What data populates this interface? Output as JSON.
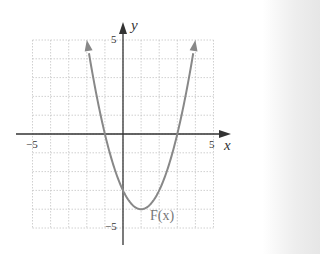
{
  "chart_data": {
    "type": "line",
    "title": "",
    "xlabel": "x",
    "ylabel": "y",
    "xlim": [
      -5,
      5
    ],
    "ylim": [
      -5,
      5
    ],
    "grid": true,
    "grid_style": "dotted",
    "x_tick_labels": [
      "-5",
      "5"
    ],
    "y_tick_labels": [
      "5",
      "-5"
    ],
    "series": [
      {
        "name": "F(x)",
        "equation": "F(x) = x^2 - 2x - 3",
        "x": [
          -2,
          -1,
          0,
          1,
          2,
          3,
          4
        ],
        "y": [
          5,
          0,
          -3,
          -4,
          -3,
          0,
          5
        ],
        "arrows_at_ends": true,
        "color": "#888888"
      }
    ],
    "annotations": [
      {
        "text": "F(x)",
        "x": 1.8,
        "y": -4.3
      }
    ],
    "key_points": {
      "x_intercepts": [
        -1,
        3
      ],
      "y_intercept": -3,
      "vertex": [
        1,
        -4
      ]
    }
  },
  "labels": {
    "x_axis": "x",
    "y_axis": "y",
    "x_min": "−5",
    "x_max": "5",
    "y_max": "5",
    "y_min": "−5",
    "curve": "F(x)"
  }
}
